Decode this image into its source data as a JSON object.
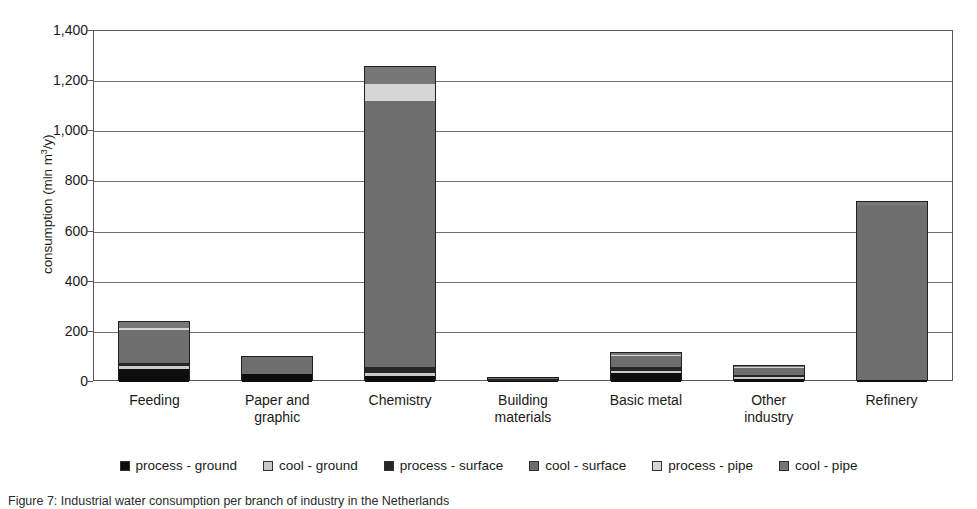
{
  "chart_data": {
    "type": "bar",
    "subtype": "stacked",
    "title": "",
    "xlabel": "",
    "ylabel": "consumption (mln m3/y)",
    "ylabel_prefix": "consumption (mln m",
    "ylabel_sup": "3",
    "ylabel_suffix": "/y)",
    "ylim": [
      0,
      1400
    ],
    "ytick_step": 200,
    "ytick_labels": [
      "0",
      "200",
      "400",
      "600",
      "800",
      "1,000",
      "1,200",
      "1,400"
    ],
    "ytick_values": [
      0,
      200,
      400,
      600,
      800,
      1000,
      1200,
      1400
    ],
    "grid": true,
    "legend_position": "bottom",
    "categories": [
      "Feeding",
      "Paper and graphic",
      "Chemistry",
      "Building materials",
      "Basic metal",
      "Other industry",
      "Refinery"
    ],
    "category_lines": [
      [
        "Feeding"
      ],
      [
        "Paper and",
        "graphic"
      ],
      [
        "Chemistry"
      ],
      [
        "Building",
        "materials"
      ],
      [
        "Basic metal"
      ],
      [
        "Other",
        "industry"
      ],
      [
        "Refinery"
      ]
    ],
    "series": [
      {
        "name": "process - ground",
        "color": "#0d0d0d",
        "values": [
          52,
          30,
          22,
          6,
          34,
          12,
          6
        ]
      },
      {
        "name": "cool - ground",
        "color": "#c9c9c9",
        "values": [
          10,
          0,
          14,
          0,
          8,
          6,
          0
        ]
      },
      {
        "name": "process - surface",
        "color": "#262626",
        "values": [
          12,
          0,
          22,
          8,
          18,
          10,
          0
        ]
      },
      {
        "name": "cool - surface",
        "color": "#6e6e6e",
        "values": [
          132,
          70,
          1064,
          4,
          42,
          28,
          698
        ]
      },
      {
        "name": "process - pipe",
        "color": "#d6d6d6",
        "values": [
          10,
          0,
          68,
          0,
          6,
          4,
          0
        ]
      },
      {
        "name": "cool - pipe",
        "color": "#777777",
        "values": [
          24,
          0,
          65,
          0,
          8,
          4,
          14
        ]
      }
    ],
    "totals": [
      240,
      100,
      1255,
      18,
      116,
      64,
      718
    ],
    "annotations": []
  },
  "legend": {
    "items": [
      {
        "label": "process - ground",
        "color": "#0d0d0d"
      },
      {
        "label": "cool - ground",
        "color": "#c9c9c9"
      },
      {
        "label": "process - surface",
        "color": "#262626"
      },
      {
        "label": "cool - surface",
        "color": "#6e6e6e"
      },
      {
        "label": "process - pipe",
        "color": "#d6d6d6"
      },
      {
        "label": "cool - pipe",
        "color": "#777777"
      }
    ]
  },
  "caption": {
    "text": "Figure 7: Industrial water consumption per branch of industry in the Netherlands"
  },
  "colors": {
    "axis": "#58595b",
    "grid": "#6e7072",
    "background": "#ffffff",
    "text": "#1a1a1a"
  }
}
